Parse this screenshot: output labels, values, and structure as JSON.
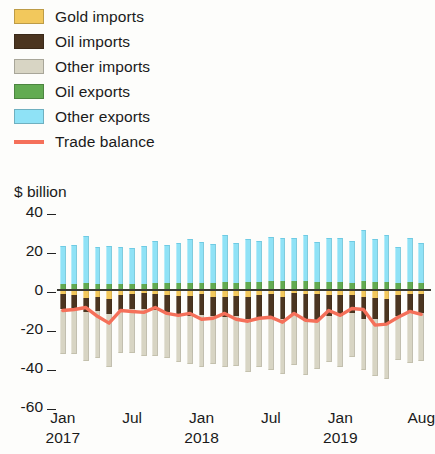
{
  "legend": {
    "items": [
      {
        "label": "Gold imports",
        "color": "#f2c85c",
        "type": "swatch",
        "name": "gold-imports"
      },
      {
        "label": "Oil imports",
        "color": "#4b3520",
        "type": "swatch",
        "name": "oil-imports"
      },
      {
        "label": "Other imports",
        "color": "#d8d5c4",
        "type": "swatch",
        "name": "other-imports"
      },
      {
        "label": "Oil exports",
        "color": "#62ab52",
        "type": "swatch",
        "name": "oil-exports"
      },
      {
        "label": "Other exports",
        "color": "#8fe2f6",
        "type": "swatch",
        "name": "other-exports"
      },
      {
        "label": "Trade balance",
        "color": "#f5705a",
        "type": "line",
        "name": "trade-balance"
      }
    ]
  },
  "axis_title": "$ billion",
  "chart_data": {
    "type": "bar",
    "title": "",
    "subtitle": "",
    "xlabel": "",
    "ylabel": "$ billion",
    "ylim": [
      -60,
      40
    ],
    "yticks": [
      40,
      20,
      0,
      -20,
      -40,
      -60
    ],
    "ytick_labels": [
      "40",
      "20",
      "0",
      "-20",
      "-40",
      "-60"
    ],
    "grid": false,
    "legend_position": "top-left",
    "stacked": true,
    "bar_count": 32,
    "x": [
      "Jan 2017",
      "Feb 2017",
      "Mar 2017",
      "Apr 2017",
      "May 2017",
      "Jun 2017",
      "Jul 2017",
      "Aug 2017",
      "Sep 2017",
      "Oct 2017",
      "Nov 2017",
      "Dec 2017",
      "Jan 2018",
      "Feb 2018",
      "Mar 2018",
      "Apr 2018",
      "May 2018",
      "Jun 2018",
      "Jul 2018",
      "Aug 2018",
      "Sep 2018",
      "Oct 2018",
      "Nov 2018",
      "Dec 2018",
      "Jan 2019",
      "Feb 2019",
      "Mar 2019",
      "Apr 2019",
      "May 2019",
      "Jun 2019",
      "Jul 2019",
      "Aug 2019"
    ],
    "xticks": [
      {
        "index": 0,
        "label": "Jan",
        "year": "2017"
      },
      {
        "index": 6,
        "label": "Jul",
        "year": ""
      },
      {
        "index": 12,
        "label": "Jan",
        "year": "2018"
      },
      {
        "index": 18,
        "label": "Jul",
        "year": ""
      },
      {
        "index": 24,
        "label": "Jan",
        "year": "2019"
      },
      {
        "index": 31,
        "label": "Aug",
        "year": ""
      }
    ],
    "series": [
      {
        "name": "Other exports",
        "color": "#8fe2f6",
        "sign": "positive",
        "values": [
          19.5,
          20.0,
          24.0,
          19.0,
          19.5,
          19.0,
          18.5,
          19.5,
          21.5,
          19.5,
          20.5,
          22.5,
          21.0,
          20.0,
          24.0,
          20.5,
          22.0,
          21.0,
          22.5,
          22.0,
          22.0,
          23.5,
          20.5,
          22.5,
          22.5,
          21.5,
          26.5,
          22.0,
          24.0,
          18.5,
          22.5,
          20.5
        ]
      },
      {
        "name": "Oil exports",
        "color": "#62ab52",
        "sign": "positive",
        "values": [
          3.0,
          3.0,
          3.5,
          3.0,
          3.0,
          3.0,
          3.0,
          3.0,
          3.5,
          3.5,
          3.5,
          3.5,
          3.5,
          3.5,
          4.0,
          3.5,
          4.0,
          4.0,
          4.5,
          4.5,
          4.5,
          4.5,
          4.0,
          4.0,
          4.0,
          3.5,
          4.5,
          4.0,
          4.0,
          3.5,
          4.0,
          3.5
        ]
      },
      {
        "name": "Gold imports",
        "color": "#f2c85c",
        "sign": "negative",
        "values": [
          2.0,
          2.5,
          4.0,
          3.5,
          4.5,
          2.5,
          2.0,
          1.5,
          2.0,
          2.5,
          3.0,
          3.0,
          2.0,
          3.5,
          3.5,
          3.0,
          3.5,
          2.5,
          2.0,
          3.5,
          1.5,
          2.0,
          2.0,
          2.5,
          2.5,
          2.5,
          3.5,
          4.0,
          4.5,
          2.5,
          2.0,
          2.0
        ]
      },
      {
        "name": "Oil imports",
        "color": "#4b3520",
        "sign": "negative",
        "values": [
          8.0,
          7.5,
          7.5,
          7.5,
          8.0,
          7.5,
          7.5,
          8.0,
          8.5,
          9.0,
          9.5,
          10.5,
          11.0,
          10.0,
          10.5,
          10.5,
          11.5,
          12.5,
          12.5,
          11.5,
          11.0,
          14.0,
          13.5,
          11.0,
          11.0,
          9.5,
          11.5,
          11.0,
          12.5,
          11.0,
          9.5,
          10.0
        ]
      },
      {
        "name": "Other imports",
        "color": "#d8d5c4",
        "sign": "negative",
        "values": [
          23.0,
          23.0,
          25.0,
          24.0,
          27.0,
          22.5,
          23.0,
          24.5,
          23.5,
          23.5,
          24.5,
          24.5,
          26.5,
          24.5,
          25.5,
          25.5,
          27.0,
          24.5,
          26.5,
          28.0,
          26.0,
          27.5,
          25.0,
          23.5,
          26.0,
          22.5,
          26.0,
          29.0,
          28.5,
          22.5,
          26.0,
          24.5
        ]
      }
    ],
    "balance_line": {
      "name": "Trade balance",
      "color": "#f5705a",
      "values": [
        -10.5,
        -10.0,
        -9.0,
        -13.5,
        -17.0,
        -10.5,
        -11.0,
        -11.5,
        -9.0,
        -12.0,
        -13.0,
        -12.0,
        -15.0,
        -14.5,
        -12.0,
        -15.0,
        -16.0,
        -14.5,
        -14.0,
        -16.5,
        -12.0,
        -15.5,
        -16.0,
        -10.5,
        -13.0,
        -9.5,
        -10.0,
        -18.0,
        -17.5,
        -14.0,
        -11.0,
        -12.5
      ]
    }
  }
}
